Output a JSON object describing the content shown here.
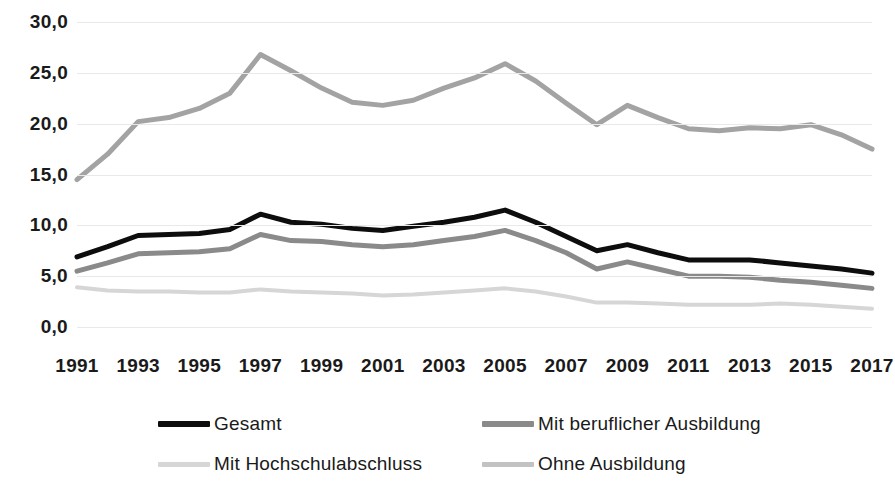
{
  "chart_data": {
    "type": "line",
    "title": "",
    "subtitle": "",
    "xlabel": "",
    "ylabel": "",
    "ylim": [
      0.0,
      30.0
    ],
    "xlim": [
      1991,
      2017
    ],
    "grid": true,
    "legend_position": "bottom",
    "y_ticks": [
      "0,0",
      "5,0",
      "10,0",
      "15,0",
      "20,0",
      "25,0",
      "30,0"
    ],
    "y_tick_values": [
      0.0,
      5.0,
      10.0,
      15.0,
      20.0,
      25.0,
      30.0
    ],
    "x": [
      1991,
      1992,
      1993,
      1994,
      1995,
      1996,
      1997,
      1998,
      1999,
      2000,
      2001,
      2002,
      2003,
      2004,
      2005,
      2006,
      2007,
      2008,
      2009,
      2010,
      2011,
      2012,
      2013,
      2014,
      2015,
      2016,
      2017
    ],
    "x_tick_labels": [
      "1991",
      "1993",
      "1995",
      "1997",
      "1999",
      "2001",
      "2003",
      "2005",
      "2007",
      "2009",
      "2011",
      "2013",
      "2015",
      "2017"
    ],
    "x_tick_values": [
      1991,
      1993,
      1995,
      1997,
      1999,
      2001,
      2003,
      2005,
      2007,
      2009,
      2011,
      2013,
      2015,
      2017
    ],
    "series": [
      {
        "name": "Gesamt",
        "color": "#0d0d0d",
        "width": 5,
        "values": [
          6.9,
          7.9,
          9.0,
          9.1,
          9.2,
          9.6,
          11.1,
          10.3,
          10.1,
          9.7,
          9.5,
          9.9,
          10.3,
          10.8,
          11.5,
          10.3,
          8.9,
          7.5,
          8.1,
          7.3,
          6.6,
          6.6,
          6.6,
          6.3,
          6.0,
          5.7,
          5.3
        ]
      },
      {
        "name": "Mit beruflicher Ausbildung",
        "color": "#8a8a8a",
        "width": 5,
        "values": [
          5.5,
          6.3,
          7.2,
          7.3,
          7.4,
          7.7,
          9.1,
          8.5,
          8.4,
          8.1,
          7.9,
          8.1,
          8.5,
          8.9,
          9.5,
          8.5,
          7.3,
          5.7,
          6.4,
          5.7,
          5.0,
          5.0,
          4.9,
          4.6,
          4.4,
          4.1,
          3.8
        ]
      },
      {
        "name": "Mit Hochschulabschluss",
        "color": "#d6d6d6",
        "width": 4,
        "values": [
          3.9,
          3.6,
          3.5,
          3.5,
          3.4,
          3.4,
          3.7,
          3.5,
          3.4,
          3.3,
          3.1,
          3.2,
          3.4,
          3.6,
          3.8,
          3.5,
          3.0,
          2.4,
          2.4,
          2.3,
          2.2,
          2.2,
          2.2,
          2.3,
          2.2,
          2.0,
          1.8
        ]
      },
      {
        "name": "Ohne Ausbildung",
        "color": "#a3a3a3",
        "width": 5,
        "values": [
          14.5,
          17.0,
          20.2,
          20.6,
          21.5,
          23.0,
          26.8,
          25.2,
          23.5,
          22.1,
          21.8,
          22.3,
          23.5,
          24.5,
          25.9,
          24.2,
          22.0,
          19.9,
          21.8,
          20.6,
          19.5,
          19.3,
          19.6,
          19.5,
          19.9,
          18.9,
          17.5
        ]
      }
    ]
  },
  "legend": {
    "items": [
      {
        "label": "Gesamt",
        "color": "#0d0d0d"
      },
      {
        "label": "Mit beruflicher Ausbildung",
        "color": "#8a8a8a"
      },
      {
        "label": "Mit Hochschulabschluss",
        "color": "#d6d6d6"
      },
      {
        "label": "Ohne Ausbildung",
        "color": "#c2c2c2"
      }
    ]
  }
}
